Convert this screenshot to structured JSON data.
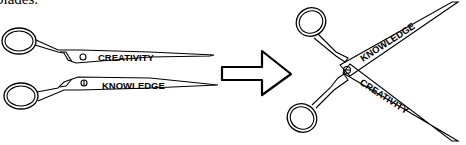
{
  "caption_fragment": "blades.",
  "diagram": {
    "before": {
      "scissors": [
        {
          "blade_label": "CREATIVITY",
          "pivot": "open-circle"
        },
        {
          "blade_label": "KNOWLEDGE",
          "pivot": "circle-with-line"
        }
      ],
      "state": "separated"
    },
    "transition": {
      "icon": "right-arrow"
    },
    "after": {
      "scissors": {
        "blades": [
          {
            "label": "KNOWLEDGE",
            "direction": "up-right"
          },
          {
            "label": "CREATIVITY",
            "direction": "down-right"
          }
        ],
        "state": "joined-at-pivot"
      }
    }
  },
  "colors": {
    "stroke": "#000000",
    "background": "#ffffff"
  }
}
